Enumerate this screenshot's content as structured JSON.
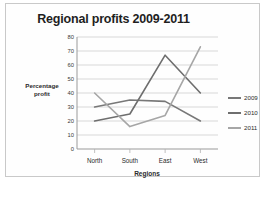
{
  "chart_data": {
    "type": "line",
    "title": "Regional profits 2009-2011",
    "xlabel": "Regions",
    "ylabel": "Percentage profit",
    "ylabel_line1": "Percentage",
    "ylabel_line2": "profit",
    "categories": [
      "North",
      "South",
      "East",
      "West"
    ],
    "yticks": [
      80,
      70,
      60,
      50,
      40,
      30,
      20,
      10,
      0
    ],
    "ylim": [
      0,
      80
    ],
    "grid": "horizontal",
    "legend_position": "right",
    "series": [
      {
        "name": "2009",
        "values": [
          30,
          35,
          34,
          20
        ],
        "color": "#787878"
      },
      {
        "name": "2010",
        "values": [
          20,
          25,
          67,
          40
        ],
        "color": "#6e6e6e"
      },
      {
        "name": "2011",
        "values": [
          40,
          16,
          24,
          73
        ],
        "color": "#a6a6a6"
      }
    ]
  }
}
